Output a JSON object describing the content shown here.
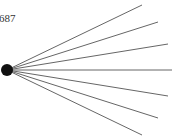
{
  "node": {
    "label": "687",
    "center": [
      7,
      70
    ],
    "radius": 6,
    "color": "#111111"
  },
  "edges": {
    "color": "#666666",
    "endpoints": [
      [
        142,
        5
      ],
      [
        158,
        22
      ],
      [
        168,
        44
      ],
      [
        172,
        70
      ],
      [
        168,
        96
      ],
      [
        158,
        118
      ],
      [
        142,
        135
      ]
    ]
  }
}
